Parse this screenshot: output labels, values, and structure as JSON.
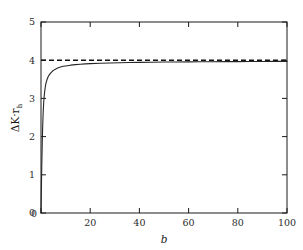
{
  "chart_data": {
    "type": "line",
    "title": "",
    "subtitle": "",
    "xlabel": "b",
    "ylabel": "ΔK·r",
    "ylabel_sub": "h",
    "xlim": [
      0,
      100
    ],
    "ylim": [
      0,
      5
    ],
    "xticks": [
      0,
      20,
      40,
      60,
      80,
      100
    ],
    "xticklabels": [
      "0",
      "20",
      "40",
      "60",
      "80",
      "100"
    ],
    "yticks": [
      0,
      1,
      2,
      3,
      4,
      5
    ],
    "yticklabels": [
      "0",
      "1",
      "2",
      "3",
      "4",
      "5"
    ],
    "grid": false,
    "legend": false,
    "legend_position": "none",
    "frame": "box",
    "tick_direction": "in",
    "background": "#ffffff",
    "series": [
      {
        "name": "ΔK·r_h",
        "style": "solid",
        "color": "#262626",
        "width": 1.1,
        "x": [
          0.0,
          0.15,
          0.3,
          0.5,
          0.7,
          0.9,
          1.1,
          1.3,
          1.6,
          1.9,
          2.2,
          2.6,
          3.0,
          3.5,
          4.0,
          4.6,
          5.2,
          6.0,
          7.0,
          8.0,
          9.0,
          10.0,
          12.0,
          14.0,
          16.0,
          18.0,
          20.0,
          24.0,
          28.0,
          32.0,
          36.0,
          40.0,
          45.0,
          50.0,
          55.0,
          60.0,
          65.0,
          70.0,
          75.0,
          80.0,
          85.0,
          90.0,
          95.0,
          100.0
        ],
        "y": [
          0.0,
          0.62,
          1.18,
          1.82,
          2.3,
          2.66,
          2.9,
          3.06,
          3.24,
          3.36,
          3.44,
          3.52,
          3.58,
          3.63,
          3.67,
          3.71,
          3.74,
          3.77,
          3.8,
          3.82,
          3.84,
          3.85,
          3.87,
          3.885,
          3.895,
          3.903,
          3.91,
          3.92,
          3.928,
          3.934,
          3.939,
          3.943,
          3.948,
          3.951,
          3.954,
          3.957,
          3.959,
          3.961,
          3.963,
          3.964,
          3.966,
          3.967,
          3.968,
          3.969
        ]
      },
      {
        "name": "asymptote",
        "style": "dashed",
        "color": "#111111",
        "width": 1.6,
        "dash": "5,3",
        "x": [
          0,
          100
        ],
        "y": [
          4,
          4
        ]
      }
    ],
    "annotations": [],
    "asymptote_value": 4
  }
}
